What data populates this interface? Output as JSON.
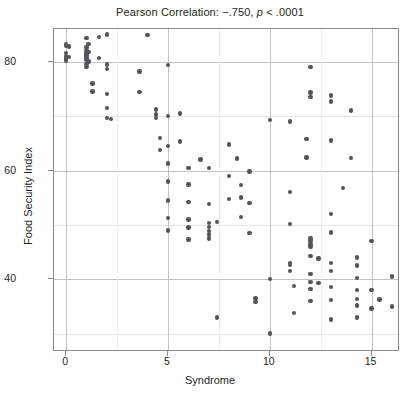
{
  "chart_data": {
    "type": "scatter",
    "title": "Pearson Correlation: −.750, p < .0001",
    "title_prefix": "Pearson Correlation: −.750, ",
    "title_italic": "p",
    "title_suffix": " < .0001",
    "xlabel": "Syndrome",
    "ylabel": "Food Security Index",
    "xlim": [
      -0.6,
      16.3
    ],
    "ylim": [
      27.0,
      86.0
    ],
    "x_ticks": [
      0,
      5,
      10,
      15
    ],
    "x_tick_labels": [
      "0",
      "5",
      "10",
      "15"
    ],
    "x_minor_ticks": [
      2.5,
      7.5,
      12.5
    ],
    "y_ticks": [
      40,
      60,
      80
    ],
    "y_tick_labels": [
      "40",
      "60",
      "80"
    ],
    "y_minor_ticks": [
      30,
      50,
      70
    ],
    "grid": true,
    "legend": "none",
    "point_color": "#55535a",
    "point_size": 4.4,
    "frame_color": "#8b8b8b",
    "grid_color": "#c2c2c2",
    "correlation": -0.75,
    "p_value": "< .0001",
    "n_points": 128,
    "points": [
      [
        0.0,
        83.2
      ],
      [
        0.0,
        82.9
      ],
      [
        0.0,
        81.6
      ],
      [
        0.0,
        81.0
      ],
      [
        0.0,
        80.6
      ],
      [
        0.0,
        80.2
      ],
      [
        0.15,
        82.8
      ],
      [
        0.15,
        80.8
      ],
      [
        1.0,
        84.3
      ],
      [
        1.0,
        82.6
      ],
      [
        1.0,
        82.0
      ],
      [
        1.0,
        81.5
      ],
      [
        1.0,
        81.1
      ],
      [
        1.0,
        80.7
      ],
      [
        1.0,
        80.3
      ],
      [
        1.0,
        79.6
      ],
      [
        1.0,
        79.0
      ],
      [
        1.1,
        83.3
      ],
      [
        1.1,
        81.8
      ],
      [
        1.1,
        80.0
      ],
      [
        1.3,
        76.0
      ],
      [
        1.3,
        74.5
      ],
      [
        1.6,
        84.5
      ],
      [
        1.6,
        80.7
      ],
      [
        2.0,
        85.0
      ],
      [
        2.0,
        79.5
      ],
      [
        2.0,
        78.6
      ],
      [
        2.0,
        74.0
      ],
      [
        2.0,
        71.5
      ],
      [
        2.0,
        69.6
      ],
      [
        2.2,
        69.5
      ],
      [
        3.6,
        78.2
      ],
      [
        3.6,
        74.4
      ],
      [
        4.0,
        84.9
      ],
      [
        4.4,
        71.2
      ],
      [
        4.4,
        70.3
      ],
      [
        4.4,
        69.6
      ],
      [
        4.6,
        66.0
      ],
      [
        4.6,
        63.8
      ],
      [
        5.0,
        79.4
      ],
      [
        5.0,
        70.0
      ],
      [
        5.0,
        64.5
      ],
      [
        5.0,
        61.3
      ],
      [
        5.0,
        58.0
      ],
      [
        5.0,
        54.5
      ],
      [
        5.0,
        51.3
      ],
      [
        5.0,
        49.0
      ],
      [
        5.6,
        70.5
      ],
      [
        5.6,
        65.3
      ],
      [
        6.0,
        60.4
      ],
      [
        6.0,
        57.4
      ],
      [
        6.0,
        54.2
      ],
      [
        6.0,
        51.0
      ],
      [
        6.0,
        49.5
      ],
      [
        6.0,
        47.3
      ],
      [
        6.6,
        62.0
      ],
      [
        7.0,
        60.5
      ],
      [
        7.0,
        53.8
      ],
      [
        7.0,
        50.3
      ],
      [
        7.0,
        49.6
      ],
      [
        7.0,
        48.9
      ],
      [
        7.0,
        48.2
      ],
      [
        7.0,
        47.5
      ],
      [
        7.4,
        50.5
      ],
      [
        7.4,
        33.0
      ],
      [
        8.0,
        64.8
      ],
      [
        8.0,
        59.0
      ],
      [
        8.0,
        54.8
      ],
      [
        8.4,
        62.2
      ],
      [
        8.6,
        57.3
      ],
      [
        8.6,
        55.0
      ],
      [
        8.6,
        51.4
      ],
      [
        9.0,
        59.8
      ],
      [
        9.0,
        54.0
      ],
      [
        9.0,
        48.5
      ],
      [
        9.3,
        36.5
      ],
      [
        9.3,
        35.8
      ],
      [
        10.0,
        69.3
      ],
      [
        10.0,
        40.0
      ],
      [
        10.0,
        30.0
      ],
      [
        11.0,
        69.0
      ],
      [
        11.0,
        56.0
      ],
      [
        11.0,
        50.2
      ],
      [
        11.0,
        43.0
      ],
      [
        11.0,
        42.6
      ],
      [
        11.0,
        41.5
      ],
      [
        11.2,
        38.8
      ],
      [
        11.2,
        33.8
      ],
      [
        11.8,
        65.8
      ],
      [
        11.8,
        62.4
      ],
      [
        12.0,
        79.0
      ],
      [
        12.0,
        74.3
      ],
      [
        12.0,
        73.5
      ],
      [
        12.0,
        47.5
      ],
      [
        12.0,
        47.0
      ],
      [
        12.0,
        46.5
      ],
      [
        12.0,
        46.0
      ],
      [
        12.0,
        44.3
      ],
      [
        12.0,
        41.0
      ],
      [
        12.0,
        39.5
      ],
      [
        12.0,
        38.2
      ],
      [
        12.0,
        36.0
      ],
      [
        12.4,
        43.8
      ],
      [
        12.4,
        39.3
      ],
      [
        13.0,
        73.8
      ],
      [
        13.0,
        72.7
      ],
      [
        13.0,
        65.5
      ],
      [
        13.0,
        52.0
      ],
      [
        13.0,
        48.6
      ],
      [
        13.0,
        43.0
      ],
      [
        13.0,
        41.5
      ],
      [
        13.0,
        38.6
      ],
      [
        13.0,
        36.2
      ],
      [
        13.0,
        32.6
      ],
      [
        13.6,
        56.8
      ],
      [
        14.0,
        71.0
      ],
      [
        14.0,
        62.3
      ],
      [
        14.3,
        44.0
      ],
      [
        14.3,
        42.5
      ],
      [
        14.3,
        40.2
      ],
      [
        14.3,
        38.0
      ],
      [
        14.3,
        36.4
      ],
      [
        14.3,
        35.2
      ],
      [
        14.3,
        33.0
      ],
      [
        15.0,
        47.0
      ],
      [
        15.0,
        38.0
      ],
      [
        15.0,
        34.6
      ],
      [
        15.4,
        36.3
      ],
      [
        16.0,
        40.5
      ],
      [
        16.0,
        35.0
      ]
    ]
  }
}
